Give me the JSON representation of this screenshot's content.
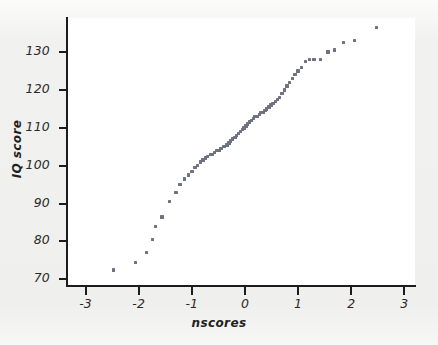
{
  "figure": {
    "background_color": "#f1f1f0",
    "plot_background_color": "#ffffff",
    "axis_color": "#1c1c1c",
    "marker_color": "#6f7280"
  },
  "chart_data": {
    "type": "scatter",
    "title": "",
    "xlabel": "nscores",
    "ylabel": "IQ score",
    "xlim": [
      -3.35,
      3.2
    ],
    "ylim": [
      68.5,
      139
    ],
    "grid": false,
    "legend": null,
    "xticks": [
      -3,
      -2,
      -1,
      0,
      1,
      2,
      3
    ],
    "xtick_labels": [
      "-3",
      "-2",
      "-1",
      "0",
      "1",
      "2",
      "3"
    ],
    "yticks": [
      70,
      80,
      90,
      100,
      110,
      120,
      130
    ],
    "ytick_labels": [
      "70",
      "80",
      "90",
      "100",
      "110",
      "120",
      "130"
    ],
    "series": [
      {
        "name": "IQ score vs normal scores",
        "marker": "square",
        "color": "#6f7280",
        "x": [
          -2.47,
          -2.06,
          -1.85,
          -1.74,
          -1.68,
          -1.56,
          -1.42,
          -1.3,
          -1.22,
          -1.14,
          -1.06,
          -1.0,
          -0.94,
          -0.89,
          -0.84,
          -0.79,
          -0.74,
          -0.7,
          -0.65,
          -0.61,
          -0.57,
          -0.53,
          -0.49,
          -0.45,
          -0.41,
          -0.38,
          -0.34,
          -0.3,
          -0.27,
          -0.23,
          -0.19,
          -0.16,
          -0.12,
          -0.09,
          -0.05,
          -0.02,
          0.02,
          0.05,
          0.09,
          0.12,
          0.16,
          0.19,
          0.23,
          0.27,
          0.3,
          0.34,
          0.38,
          0.41,
          0.45,
          0.49,
          0.53,
          0.57,
          0.61,
          0.65,
          0.7,
          0.74,
          0.79,
          0.84,
          0.89,
          0.94,
          1.0,
          1.06,
          1.14,
          1.22,
          1.3,
          1.42,
          1.56,
          1.68,
          1.85,
          2.06,
          2.47
        ],
        "y": [
          72.5,
          74.5,
          77.0,
          80.5,
          84.0,
          86.5,
          90.5,
          93.0,
          95.0,
          96.5,
          97.5,
          98.5,
          99.5,
          100.0,
          101.0,
          101.5,
          102.0,
          102.5,
          103.0,
          103.0,
          103.5,
          104.0,
          104.0,
          104.5,
          105.0,
          105.0,
          105.5,
          106.0,
          106.5,
          107.0,
          107.5,
          108.0,
          108.5,
          109.0,
          109.5,
          110.0,
          110.5,
          111.0,
          111.5,
          112.0,
          112.5,
          113.0,
          113.0,
          113.5,
          114.0,
          114.0,
          114.5,
          115.0,
          115.5,
          116.0,
          116.5,
          117.0,
          117.5,
          118.0,
          119.0,
          120.0,
          121.0,
          122.0,
          123.0,
          124.0,
          125.0,
          126.0,
          127.5,
          128.0,
          128.0,
          128.0,
          130.0,
          130.5,
          132.5,
          133.0,
          136.5
        ]
      }
    ]
  }
}
